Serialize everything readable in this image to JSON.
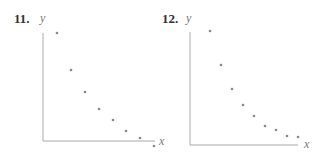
{
  "chart_data": [
    {
      "type": "scatter",
      "label": "11.",
      "xlabel": "x",
      "ylabel": "y",
      "grid": false,
      "ticks": false,
      "axes_px": {
        "origin": [
          43,
          141
        ],
        "x_end": 155,
        "y_top": 33
      },
      "points_px": [
        [
          57,
          33
        ],
        [
          71,
          70
        ],
        [
          85,
          92
        ],
        [
          99,
          109
        ],
        [
          113,
          120
        ],
        [
          126,
          131
        ],
        [
          140,
          138
        ],
        [
          154,
          146
        ]
      ],
      "points": [
        {
          "x": 1,
          "y": 10.0
        },
        {
          "x": 2,
          "y": 6.6
        },
        {
          "x": 3,
          "y": 4.6
        },
        {
          "x": 4,
          "y": 3.0
        },
        {
          "x": 5,
          "y": 2.0
        },
        {
          "x": 6,
          "y": 1.0
        },
        {
          "x": 7,
          "y": 0.3
        },
        {
          "x": 8,
          "y": -0.5
        }
      ],
      "point_color": "#888888",
      "axis_color": "#aaaaaa"
    },
    {
      "type": "scatter",
      "label": "12.",
      "xlabel": "x",
      "ylabel": "y",
      "grid": false,
      "ticks": false,
      "axes_px": {
        "origin": [
          190,
          145
        ],
        "x_end": 298,
        "y_top": 32
      },
      "points_px": [
        [
          210,
          31
        ],
        [
          221,
          65
        ],
        [
          232,
          89
        ],
        [
          243,
          105
        ],
        [
          254,
          116
        ],
        [
          265,
          126
        ],
        [
          276,
          130
        ],
        [
          287,
          136
        ],
        [
          298,
          137
        ]
      ],
      "points": [
        {
          "x": 1,
          "y": 10.0
        },
        {
          "x": 2,
          "y": 7.0
        },
        {
          "x": 3,
          "y": 4.9
        },
        {
          "x": 4,
          "y": 3.5
        },
        {
          "x": 5,
          "y": 2.5
        },
        {
          "x": 6,
          "y": 1.7
        },
        {
          "x": 7,
          "y": 1.3
        },
        {
          "x": 8,
          "y": 0.8
        },
        {
          "x": 9,
          "y": 0.7
        }
      ],
      "point_color": "#888888",
      "axis_color": "#aaaaaa"
    }
  ],
  "labels": {
    "p11": {
      "num": "11.",
      "y": "y",
      "x": "x"
    },
    "p12": {
      "num": "12.",
      "y": "y",
      "x": "x"
    }
  }
}
